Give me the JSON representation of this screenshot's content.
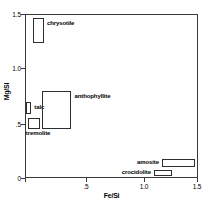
{
  "chart_data": {
    "type": "scatter",
    "title": "",
    "xlabel": "Fe/Si",
    "ylabel": "Mg/Si",
    "xlim": [
      0,
      1.5
    ],
    "ylim": [
      0,
      1.5
    ],
    "xticks": [
      "0",
      ".5",
      "1.0",
      "1.5"
    ],
    "xtick_values": [
      0,
      0.5,
      1.0,
      1.5
    ],
    "yticks": [
      "0",
      ".5",
      "1.0",
      "1.5"
    ],
    "ytick_values": [
      0,
      0.5,
      1.0,
      1.5
    ],
    "grid": false,
    "legend": "inline-labels",
    "boxes": [
      {
        "name": "chrysotile",
        "x_min": 0.07,
        "x_max": 0.165,
        "y_min": 1.235,
        "y_max": 1.465,
        "label": "chrysotile",
        "label_side": "right"
      },
      {
        "name": "talc",
        "x_min": 0.01,
        "x_max": 0.055,
        "y_min": 0.585,
        "y_max": 0.695,
        "label": "talc",
        "label_side": "right"
      },
      {
        "name": "anthophyllite",
        "x_min": 0.145,
        "x_max": 0.405,
        "y_min": 0.445,
        "y_max": 0.8,
        "label": "anthophyllite",
        "label_side": "right"
      },
      {
        "name": "tremolite",
        "x_min": 0.025,
        "x_max": 0.13,
        "y_min": 0.445,
        "y_max": 0.545,
        "label": "tremolite",
        "label_side": "below"
      },
      {
        "name": "amosite",
        "x_min": 1.195,
        "x_max": 1.48,
        "y_min": 0.1,
        "y_max": 0.175,
        "label": "amosite",
        "label_side": "left"
      },
      {
        "name": "crocidolite",
        "x_min": 1.125,
        "x_max": 1.28,
        "y_min": 0.02,
        "y_max": 0.075,
        "label": "crocidolite",
        "label_side": "left"
      }
    ]
  },
  "style": {
    "axis_color": "#3a3a3a",
    "box_color": "#2e2e2e",
    "background": "#ffffff"
  }
}
